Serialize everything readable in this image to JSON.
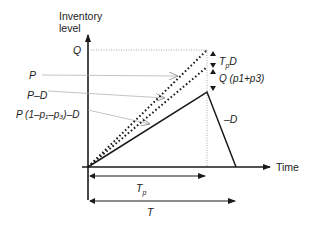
{
  "diagram": {
    "y_axis_label_line1": "Inventory",
    "y_axis_label_line2": "level",
    "x_axis_label": "Time",
    "left_labels": {
      "q": "Q",
      "p": "P",
      "p_minus_d": "P–D",
      "effective_rate": "P (1–p₁–p₃)–D"
    },
    "right_labels": {
      "tp_d": "TpD",
      "tp_d_main": "T",
      "tp_d_sub": "p",
      "tp_d_tail": "D",
      "q_p1_p3": "Q (p1+p3)",
      "minus_d": "–D"
    },
    "bottom_labels": {
      "tp": "Tp",
      "tp_main": "T",
      "tp_sub": "p",
      "t": "T"
    },
    "colors": {
      "line": "#1a1a1a",
      "guide": "#9a9a9a"
    }
  }
}
